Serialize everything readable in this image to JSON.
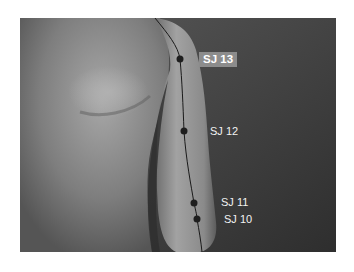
{
  "figure": {
    "colors": {
      "background": "#ffffff",
      "photo_bg_dark": "#3a3a3a",
      "skin_light": "#9a9a9a",
      "point": "#1e1e1e",
      "label_box": "#8c8c8c",
      "label_text": "#ffffff"
    },
    "points": [
      {
        "id": "sj13",
        "label": "SJ 13",
        "highlighted": true,
        "x": 180,
        "y": 59,
        "label_x": 199,
        "label_y": 52
      },
      {
        "id": "sj12",
        "label": "SJ 12",
        "highlighted": false,
        "x": 184,
        "y": 131,
        "label_x": 210,
        "label_y": 125
      },
      {
        "id": "sj11",
        "label": "SJ 11",
        "highlighted": false,
        "x": 194,
        "y": 203,
        "label_x": 221,
        "label_y": 196
      },
      {
        "id": "sj10",
        "label": "SJ 10",
        "highlighted": false,
        "x": 197,
        "y": 219,
        "label_x": 224,
        "label_y": 213
      }
    ]
  }
}
